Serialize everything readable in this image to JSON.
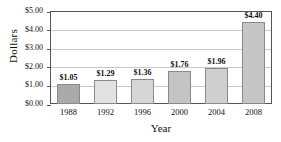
{
  "chart_data": {
    "type": "bar",
    "title": "",
    "xlabel": "Year",
    "ylabel": "Dollars",
    "categories": [
      "1988",
      "1992",
      "1996",
      "2000",
      "2004",
      "2008"
    ],
    "values": [
      1.05,
      1.29,
      1.36,
      1.76,
      1.96,
      4.4
    ],
    "value_labels": [
      "$1.05",
      "$1.29",
      "$1.36",
      "$1.76",
      "$1.96",
      "$4.40"
    ],
    "bar_colors": [
      "#a9a9a9",
      "#e2e2e2",
      "#d6d6d6",
      "#c4c4c4",
      "#cfcfcf",
      "#c6c6c6"
    ],
    "bar_border_color": "#8a8a8a",
    "ylim": [
      0,
      5
    ],
    "ytick_values": [
      0,
      1,
      2,
      3,
      4,
      5
    ],
    "ytick_labels": [
      "$0.00",
      "$1.00",
      "$2.00",
      "$3.00",
      "$4.00",
      "$5.00"
    ],
    "grid": true,
    "grid_color": "#c9c9c9",
    "frame_color": "#555555",
    "legend": null,
    "legend_position": "none"
  }
}
